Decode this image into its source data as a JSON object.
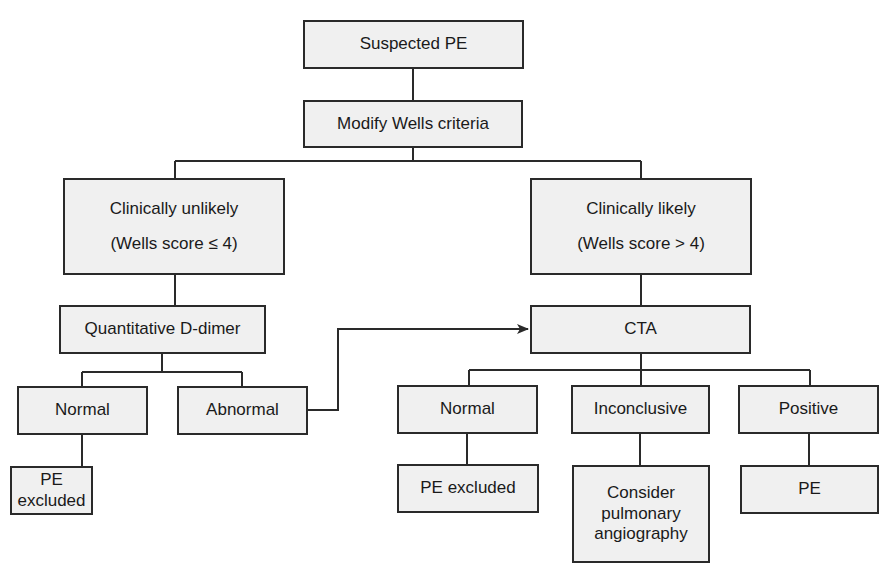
{
  "flowchart": {
    "suspected": "Suspected PE",
    "wells": "Modify Wells criteria",
    "unlikely": {
      "line1": "Clinically unlikely",
      "line2": "(Wells score ≤ 4)"
    },
    "likely": {
      "line1": "Clinically likely",
      "line2": "(Wells score > 4)"
    },
    "ddimer": "Quantitative D-dimer",
    "dd_normal": "Normal",
    "dd_abnormal": "Abnormal",
    "dd_excluded": "PE excluded",
    "cta": "CTA",
    "cta_normal": "Normal",
    "cta_inconclusive": "Inconclusive",
    "cta_positive": "Positive",
    "cta_excluded": "PE excluded",
    "consider": {
      "line1": "Consider",
      "line2": "pulmonary",
      "line3": "angiography"
    },
    "pe": "PE"
  },
  "colors": {
    "box_fill": "#f0f0f0",
    "line": "#2a2a2a"
  }
}
